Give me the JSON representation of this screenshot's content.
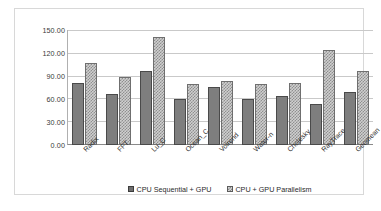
{
  "chart_data": {
    "type": "bar",
    "title": "",
    "subtitle": "",
    "xlabel": "",
    "ylabel": "",
    "ylim": [
      0,
      150
    ],
    "yticks": [
      "0.00",
      "30.00",
      "60.00",
      "90.00",
      "120.00",
      "150.00"
    ],
    "ytick_values": [
      0,
      30,
      60,
      90,
      120,
      150
    ],
    "grid": true,
    "legend_position": "bottom",
    "categories": [
      "Radix",
      "FFT",
      "Lu_C",
      "Ocean_C",
      "Volrend",
      "Water-n",
      "Cholesky",
      "RayTrace",
      "Geomean"
    ],
    "series": [
      {
        "name": "CPU Sequential + GPU",
        "fill": "solid-gray",
        "color": "#7e7e7e",
        "values": [
          81,
          67,
          96,
          60,
          76,
          60,
          64,
          54,
          69
        ]
      },
      {
        "name": "CPU + GPU Parallelism",
        "fill": "checkered-gray",
        "color": "#cfcfcf",
        "values": [
          107,
          89,
          141,
          79,
          84,
          79,
          81,
          124,
          96
        ]
      }
    ]
  },
  "legend": {
    "items": [
      {
        "label": "CPU Sequential + GPU",
        "marker": "solid-square-marker"
      },
      {
        "label": "CPU + GPU Parallelism",
        "marker": "checkered-square-marker"
      }
    ]
  }
}
